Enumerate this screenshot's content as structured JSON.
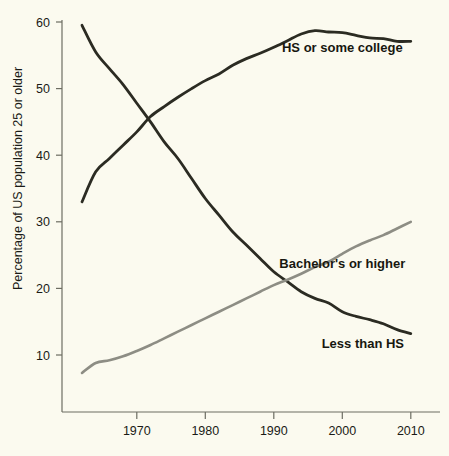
{
  "chart_data": {
    "type": "line",
    "title": "",
    "subtitle": "",
    "xlabel": "",
    "ylabel": "Percentage of US population 25 or older",
    "xlim": [
      1962,
      2010
    ],
    "ylim": [
      0,
      60
    ],
    "grid": false,
    "legend_position": "inline-annotations",
    "xticks": [
      1970,
      1980,
      1990,
      2000,
      2010
    ],
    "xtick_labels": [
      "1970",
      "1980",
      "1990",
      "2000",
      "2010"
    ],
    "yticks": [
      10,
      20,
      30,
      40,
      50,
      60
    ],
    "ytick_labels": [
      "10",
      "20",
      "30",
      "40",
      "50",
      "60"
    ],
    "x": [
      1962,
      1964,
      1966,
      1968,
      1970,
      1972,
      1974,
      1976,
      1978,
      1980,
      1982,
      1984,
      1986,
      1988,
      1990,
      1992,
      1994,
      1996,
      1998,
      2000,
      2002,
      2004,
      2006,
      2008,
      2010
    ],
    "series": [
      {
        "name": "HS or some college",
        "color": "#2b2b22",
        "label": "HS or some college",
        "label_x": 2000,
        "label_y": 55.5,
        "values": [
          33.0,
          37.5,
          39.5,
          41.5,
          43.5,
          45.8,
          47.3,
          48.7,
          50.0,
          51.2,
          52.2,
          53.5,
          54.5,
          55.3,
          56.2,
          57.2,
          58.2,
          58.7,
          58.5,
          58.4,
          58.0,
          57.6,
          57.5,
          57.1,
          57.1
        ]
      },
      {
        "name": "Less than HS",
        "color": "#2b2b22",
        "label": "Less than HS",
        "label_x": 2003,
        "label_y": 11.0,
        "values": [
          59.5,
          55.5,
          53.0,
          50.6,
          47.8,
          45.0,
          42.0,
          39.5,
          36.5,
          33.5,
          31.0,
          28.5,
          26.5,
          24.5,
          22.5,
          21.0,
          19.5,
          18.5,
          17.8,
          16.5,
          15.8,
          15.3,
          14.7,
          13.8,
          13.2
        ]
      },
      {
        "name": "Bachelor's or higher",
        "color": "#8d8d84",
        "label": "Bachelor's or higher",
        "label_x": 2000,
        "label_y": 23.0,
        "values": [
          7.3,
          8.8,
          9.2,
          9.8,
          10.6,
          11.5,
          12.5,
          13.5,
          14.5,
          15.5,
          16.5,
          17.5,
          18.5,
          19.5,
          20.5,
          21.3,
          22.2,
          23.2,
          24.0,
          25.2,
          26.3,
          27.2,
          28.0,
          29.0,
          30.0
        ]
      }
    ]
  },
  "axes": {
    "y_axis_title": "Percentage of US population 25 or older"
  }
}
